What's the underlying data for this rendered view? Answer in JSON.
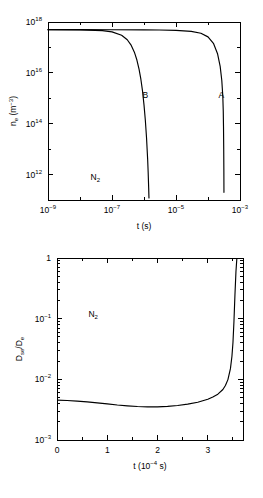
{
  "figure": {
    "background": "#ffffff",
    "line_color": "#000000"
  },
  "chart_data": [
    {
      "id": "top",
      "type": "line",
      "title": "",
      "xlabel": "t (s)",
      "ylabel": "n_e (m^-3)",
      "ylabel_parts": {
        "base": "n",
        "sub": "e",
        "unit_open": " (m",
        "unit_sup": "−3",
        "unit_close": ")"
      },
      "xscale": "log",
      "yscale": "log",
      "xlim": [
        1e-09,
        0.001
      ],
      "ylim": [
        100000000000.0,
        1e+18
      ],
      "grid": false,
      "legend": "none",
      "xticks": [
        1e-09,
        1e-07,
        1e-05,
        0.001
      ],
      "xtick_labels": [
        "10−9",
        "10−7",
        "10−5",
        "10−3"
      ],
      "xtick_mantissa": "10",
      "xtick_exponents": [
        "−9",
        "−7",
        "−5",
        "−3"
      ],
      "yticks": [
        1000000000000.0,
        100000000000000.0,
        1e+16,
        1e+18
      ],
      "ytick_mantissa": "10",
      "ytick_exponents": [
        "12",
        "14",
        "16",
        "18"
      ],
      "xminor_ticks": [
        1e-08,
        1e-06,
        0.0001
      ],
      "yminor_ticks": [
        100000000000.0,
        10000000000000.0,
        1000000000000000.0,
        1e+17
      ],
      "annotations": [
        {
          "text": "N",
          "sub": "2",
          "x": 3e-08,
          "y": 600000000000.0,
          "name": "gas-label-n2"
        },
        {
          "text": "B",
          "sub": "",
          "x": 1.1e-06,
          "y": 1000000000000000.0,
          "name": "curve-label-b"
        },
        {
          "text": "A",
          "sub": "",
          "x": 0.00026,
          "y": 1000000000000000.0,
          "name": "curve-label-a"
        }
      ],
      "series": [
        {
          "name": "A",
          "label": "A",
          "points_x": [
            1e-09,
            1e-08,
            1e-07,
            1e-06,
            3e-06,
            1e-05,
            3e-05,
            6e-05,
            0.0001,
            0.00015,
            0.0002,
            0.00024,
            0.00027,
            0.00029,
            0.0003,
            0.000305,
            0.00031,
            0.000313,
            0.000315
          ],
          "points_y": [
            5e+17,
            5e+17,
            4.95e+17,
            4.9e+17,
            4.85e+17,
            4.7e+17,
            4.3e+17,
            3.6e+17,
            2.6e+17,
            1.4e+17,
            5.5e+16,
            1.8e+16,
            5000000000000000.0,
            1200000000000000.0,
            300000000000000.0,
            80000000000000.0,
            10000000000000.0,
            1500000000000.0,
            200000000000.0
          ]
        },
        {
          "name": "B",
          "label": "B",
          "points_x": [
            1e-09,
            1e-08,
            5e-08,
            1e-07,
            2e-07,
            3e-07,
            4e-07,
            5e-07,
            6e-07,
            7e-07,
            8e-07,
            9e-07,
            1e-06,
            1.1e-06,
            1.2e-06,
            1.3e-06,
            1.35e-06,
            1.4e-06,
            1.43e-06
          ],
          "points_y": [
            5e+17,
            4.9e+17,
            4.6e+17,
            4.1e+17,
            3e+17,
            2e+17,
            1.2e+17,
            6.5e+16,
            3.2e+16,
            1.4e+16,
            5500000000000000.0,
            1900000000000000.0,
            550000000000000.0,
            140000000000000.0,
            28000000000000.0,
            4000000000000.0,
            1200000000000.0,
            300000000000.0,
            120000000000.0
          ]
        }
      ]
    },
    {
      "id": "bottom",
      "type": "line",
      "title": "",
      "xlabel": "t (10^-4 s)",
      "xlabel_parts": {
        "base": "t (10",
        "sup": "−4",
        "close": " s)"
      },
      "ylabel": "D_se/D_e",
      "ylabel_parts": {
        "num_base": "D",
        "num_sub": "se",
        "slash": "/",
        "den_base": "D",
        "den_sub": "e"
      },
      "xscale": "linear",
      "yscale": "log",
      "xlim": [
        0,
        3.7
      ],
      "ylim": [
        0.001,
        1
      ],
      "grid": false,
      "legend": "none",
      "xticks": [
        0,
        1,
        2,
        3
      ],
      "xtick_labels": [
        "0",
        "1",
        "2",
        "3"
      ],
      "xminor_ticks": [
        0.5,
        1.5,
        2.5,
        3.5
      ],
      "yticks": [
        0.001,
        0.01,
        0.1,
        1
      ],
      "ytick_labels": [
        "10−3",
        "10−2",
        "10−1",
        "1"
      ],
      "ytick_mantissa": "10",
      "ytick_exponents": [
        "−3",
        "−2",
        "−1",
        ""
      ],
      "annotations": [
        {
          "text": "N",
          "sub": "2",
          "x": 0.72,
          "y": 0.105,
          "name": "gas-label-n2"
        }
      ],
      "series": [
        {
          "name": "Dse/De",
          "label": "",
          "points_x": [
            0.0,
            0.2,
            0.4,
            0.6,
            0.8,
            1.0,
            1.2,
            1.4,
            1.6,
            1.8,
            2.0,
            2.2,
            2.4,
            2.6,
            2.8,
            3.0,
            3.1,
            3.2,
            3.3,
            3.35,
            3.4,
            3.45,
            3.48,
            3.5,
            3.52,
            3.54,
            3.56,
            3.58
          ],
          "points_y": [
            0.00455,
            0.00448,
            0.00438,
            0.00425,
            0.0041,
            0.00394,
            0.00378,
            0.00366,
            0.00357,
            0.00352,
            0.00352,
            0.00358,
            0.0037,
            0.0039,
            0.0042,
            0.0047,
            0.0051,
            0.0057,
            0.0068,
            0.0079,
            0.0099,
            0.015,
            0.024,
            0.04,
            0.09,
            0.25,
            0.6,
            1.05
          ]
        }
      ]
    }
  ]
}
